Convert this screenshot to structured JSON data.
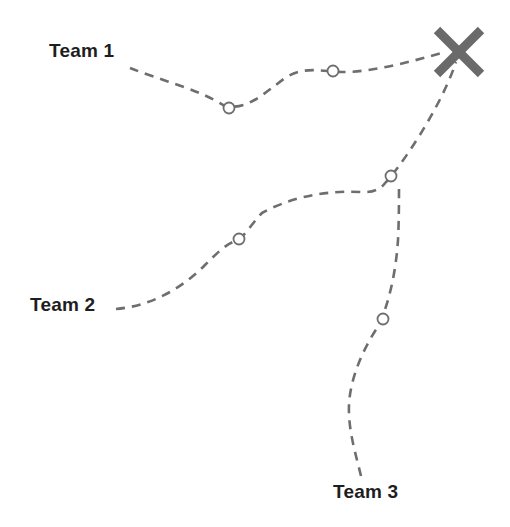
{
  "diagram": {
    "type": "route-map",
    "colors": {
      "background": "#ffffff",
      "route": "#6e6e6e",
      "waypoint_stroke": "#6e6e6e",
      "target": "#6a6a6a",
      "label": "#1e1e1e"
    },
    "target": {
      "icon": "x-mark-icon",
      "center": [
        459,
        52
      ],
      "half_size": 22
    },
    "teams": [
      {
        "id": "team-1",
        "label": "Team 1",
        "label_pos": [
          49,
          40
        ],
        "path": "M130,68 C160,80 200,90 223,105 C245,112 262,95 285,78 C300,68 315,70 327,71 C360,76 410,62 445,52",
        "waypoints": [
          [
            229,
            108
          ],
          [
            333,
            71
          ]
        ]
      },
      {
        "id": "team-2",
        "label": "Team 2",
        "label_pos": [
          30,
          294
        ],
        "path": "M116,309 C150,306 180,290 205,265 C215,255 225,245 233,242 C245,238 250,225 262,213 C285,200 320,190 360,192 C372,193 380,190 386,182 C398,170 440,110 456,62",
        "waypoints": [
          [
            239,
            239
          ],
          [
            391,
            176
          ]
        ]
      },
      {
        "id": "team-3",
        "label": "Team 3",
        "label_pos": [
          333,
          481
        ],
        "path": "M361,476 C356,455 348,430 349,405 C350,380 362,350 379,325 C390,300 396,270 398,240 C399,220 399,200 399,186",
        "waypoints": [
          [
            383,
            319
          ]
        ]
      }
    ]
  }
}
